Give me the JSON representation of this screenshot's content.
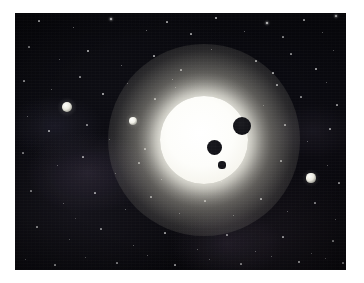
{
  "page": {
    "width": 364,
    "height": 283,
    "background_color": "#ffffff"
  },
  "image_frame": {
    "left": 15,
    "top": 13,
    "width": 331,
    "height": 257,
    "border_color": "#ffffff",
    "space_color": "#07070b"
  },
  "scene": {
    "type": "space-illustration",
    "description": "A bright white host star with three dark planets silhouetted in transit across its disk, plus three illuminated planets in the surrounding starfield",
    "background_color": "#07070b",
    "star_color": "#fffff5",
    "planet_shadow_color": "#14141a",
    "lit_planet_color": "#eceae2"
  },
  "host_star": {
    "name": "host-star",
    "center_x": 189,
    "center_y": 127,
    "radius": 44,
    "glow_radius": 96,
    "color": "#ffffff",
    "glow_color": "#fffdf0"
  },
  "transiting_planets": [
    {
      "name": "transit-planet-large-upper-right",
      "cx": 227,
      "cy": 113,
      "r": 9,
      "color": "#1b1b20"
    },
    {
      "name": "transit-planet-medium-center",
      "cx": 199,
      "cy": 134,
      "r": 7.5,
      "color": "#17171c"
    },
    {
      "name": "transit-planet-small-lower",
      "cx": 207,
      "cy": 152,
      "r": 3.6,
      "color": "#17171c"
    }
  ],
  "field_planets": [
    {
      "name": "field-planet-far-left",
      "cx": 52,
      "cy": 94,
      "r": 5.2,
      "color": "#e6e5dc"
    },
    {
      "name": "field-planet-mid-left",
      "cx": 118,
      "cy": 108,
      "r": 4.2,
      "color": "#eeede5"
    },
    {
      "name": "field-planet-right",
      "cx": 296,
      "cy": 165,
      "r": 4.6,
      "color": "#eceae1"
    }
  ],
  "background_stars": [
    {
      "x": 24,
      "y": 8,
      "s": 1.2,
      "o": 0.7
    },
    {
      "x": 58,
      "y": 14,
      "s": 1.0,
      "o": 0.55
    },
    {
      "x": 96,
      "y": 6,
      "s": 1.4,
      "o": 0.8
    },
    {
      "x": 131,
      "y": 17,
      "s": 1.0,
      "o": 0.5
    },
    {
      "x": 152,
      "y": 9,
      "s": 1.2,
      "o": 0.62
    },
    {
      "x": 176,
      "y": 21,
      "s": 1.1,
      "o": 0.58
    },
    {
      "x": 201,
      "y": 5,
      "s": 1.3,
      "o": 0.72
    },
    {
      "x": 229,
      "y": 18,
      "s": 1.0,
      "o": 0.48
    },
    {
      "x": 252,
      "y": 10,
      "s": 1.5,
      "o": 0.85
    },
    {
      "x": 268,
      "y": 24,
      "s": 1.1,
      "o": 0.55
    },
    {
      "x": 289,
      "y": 7,
      "s": 1.2,
      "o": 0.66
    },
    {
      "x": 307,
      "y": 19,
      "s": 1.0,
      "o": 0.5
    },
    {
      "x": 321,
      "y": 3,
      "s": 1.6,
      "o": 0.9
    },
    {
      "x": 14,
      "y": 34,
      "s": 1.1,
      "o": 0.52
    },
    {
      "x": 44,
      "y": 46,
      "s": 1.0,
      "o": 0.45
    },
    {
      "x": 73,
      "y": 38,
      "s": 1.3,
      "o": 0.68
    },
    {
      "x": 106,
      "y": 52,
      "s": 1.0,
      "o": 0.46
    },
    {
      "x": 139,
      "y": 43,
      "s": 1.2,
      "o": 0.6
    },
    {
      "x": 166,
      "y": 57,
      "s": 1.1,
      "o": 0.52
    },
    {
      "x": 196,
      "y": 36,
      "s": 1.0,
      "o": 0.44
    },
    {
      "x": 241,
      "y": 48,
      "s": 1.2,
      "o": 0.58
    },
    {
      "x": 276,
      "y": 41,
      "s": 1.1,
      "o": 0.54
    },
    {
      "x": 301,
      "y": 56,
      "s": 1.3,
      "o": 0.7
    },
    {
      "x": 318,
      "y": 37,
      "s": 1.0,
      "o": 0.48
    },
    {
      "x": 9,
      "y": 68,
      "s": 1.2,
      "o": 0.56
    },
    {
      "x": 36,
      "y": 76,
      "s": 1.0,
      "o": 0.44
    },
    {
      "x": 65,
      "y": 64,
      "s": 1.1,
      "o": 0.5
    },
    {
      "x": 88,
      "y": 81,
      "s": 1.3,
      "o": 0.66
    },
    {
      "x": 112,
      "y": 70,
      "s": 1.0,
      "o": 0.46
    },
    {
      "x": 140,
      "y": 86,
      "s": 1.1,
      "o": 0.52
    },
    {
      "x": 157,
      "y": 66,
      "s": 1.0,
      "o": 0.44
    },
    {
      "x": 262,
      "y": 72,
      "s": 1.2,
      "o": 0.58
    },
    {
      "x": 286,
      "y": 84,
      "s": 1.1,
      "o": 0.5
    },
    {
      "x": 311,
      "y": 69,
      "s": 1.0,
      "o": 0.46
    },
    {
      "x": 322,
      "y": 92,
      "s": 1.2,
      "o": 0.6
    },
    {
      "x": 12,
      "y": 103,
      "s": 1.0,
      "o": 0.44
    },
    {
      "x": 34,
      "y": 118,
      "s": 1.2,
      "o": 0.58
    },
    {
      "x": 72,
      "y": 112,
      "s": 1.1,
      "o": 0.5
    },
    {
      "x": 94,
      "y": 126,
      "s": 1.0,
      "o": 0.42
    },
    {
      "x": 130,
      "y": 136,
      "s": 1.1,
      "o": 0.48
    },
    {
      "x": 148,
      "y": 120,
      "s": 1.0,
      "o": 0.44
    },
    {
      "x": 270,
      "y": 112,
      "s": 1.1,
      "o": 0.52
    },
    {
      "x": 292,
      "y": 128,
      "s": 1.0,
      "o": 0.44
    },
    {
      "x": 315,
      "y": 116,
      "s": 1.2,
      "o": 0.58
    },
    {
      "x": 8,
      "y": 140,
      "s": 1.1,
      "o": 0.48
    },
    {
      "x": 42,
      "y": 152,
      "s": 1.0,
      "o": 0.42
    },
    {
      "x": 68,
      "y": 144,
      "s": 1.2,
      "o": 0.56
    },
    {
      "x": 100,
      "y": 160,
      "s": 1.0,
      "o": 0.44
    },
    {
      "x": 124,
      "y": 150,
      "s": 1.1,
      "o": 0.5
    },
    {
      "x": 146,
      "y": 166,
      "s": 1.0,
      "o": 0.42
    },
    {
      "x": 266,
      "y": 148,
      "s": 1.1,
      "o": 0.5
    },
    {
      "x": 312,
      "y": 152,
      "s": 1.0,
      "o": 0.44
    },
    {
      "x": 324,
      "y": 170,
      "s": 1.2,
      "o": 0.56
    },
    {
      "x": 16,
      "y": 178,
      "s": 1.1,
      "o": 0.48
    },
    {
      "x": 48,
      "y": 190,
      "s": 1.0,
      "o": 0.42
    },
    {
      "x": 80,
      "y": 180,
      "s": 1.2,
      "o": 0.56
    },
    {
      "x": 110,
      "y": 196,
      "s": 1.0,
      "o": 0.44
    },
    {
      "x": 136,
      "y": 184,
      "s": 1.1,
      "o": 0.5
    },
    {
      "x": 164,
      "y": 200,
      "s": 1.0,
      "o": 0.42
    },
    {
      "x": 190,
      "y": 188,
      "s": 1.1,
      "o": 0.48
    },
    {
      "x": 218,
      "y": 202,
      "s": 1.0,
      "o": 0.44
    },
    {
      "x": 246,
      "y": 186,
      "s": 1.2,
      "o": 0.56
    },
    {
      "x": 272,
      "y": 198,
      "s": 1.0,
      "o": 0.42
    },
    {
      "x": 300,
      "y": 190,
      "s": 1.1,
      "o": 0.5
    },
    {
      "x": 320,
      "y": 206,
      "s": 1.0,
      "o": 0.44
    },
    {
      "x": 22,
      "y": 214,
      "s": 1.2,
      "o": 0.58
    },
    {
      "x": 54,
      "y": 226,
      "s": 1.0,
      "o": 0.42
    },
    {
      "x": 86,
      "y": 216,
      "s": 1.1,
      "o": 0.5
    },
    {
      "x": 118,
      "y": 232,
      "s": 1.0,
      "o": 0.44
    },
    {
      "x": 150,
      "y": 220,
      "s": 1.2,
      "o": 0.56
    },
    {
      "x": 182,
      "y": 236,
      "s": 1.0,
      "o": 0.42
    },
    {
      "x": 212,
      "y": 222,
      "s": 1.1,
      "o": 0.5
    },
    {
      "x": 240,
      "y": 238,
      "s": 1.0,
      "o": 0.44
    },
    {
      "x": 268,
      "y": 224,
      "s": 1.2,
      "o": 0.58
    },
    {
      "x": 296,
      "y": 240,
      "s": 1.0,
      "o": 0.42
    },
    {
      "x": 318,
      "y": 228,
      "s": 1.1,
      "o": 0.5
    },
    {
      "x": 10,
      "y": 246,
      "s": 1.0,
      "o": 0.44
    },
    {
      "x": 40,
      "y": 252,
      "s": 1.2,
      "o": 0.56
    },
    {
      "x": 70,
      "y": 244,
      "s": 1.0,
      "o": 0.42
    },
    {
      "x": 102,
      "y": 250,
      "s": 1.1,
      "o": 0.5
    },
    {
      "x": 132,
      "y": 242,
      "s": 1.0,
      "o": 0.44
    },
    {
      "x": 160,
      "y": 252,
      "s": 1.2,
      "o": 0.56
    },
    {
      "x": 194,
      "y": 246,
      "s": 1.0,
      "o": 0.42
    },
    {
      "x": 226,
      "y": 251,
      "s": 1.1,
      "o": 0.5
    },
    {
      "x": 256,
      "y": 243,
      "s": 1.0,
      "o": 0.44
    },
    {
      "x": 284,
      "y": 249,
      "s": 1.3,
      "o": 0.66
    },
    {
      "x": 310,
      "y": 245,
      "s": 1.0,
      "o": 0.42
    },
    {
      "x": 328,
      "y": 250,
      "s": 1.1,
      "o": 0.5
    },
    {
      "x": 160,
      "y": 74,
      "s": 1.0,
      "o": 0.4
    },
    {
      "x": 248,
      "y": 92,
      "s": 1.0,
      "o": 0.4
    },
    {
      "x": 258,
      "y": 60,
      "s": 1.2,
      "o": 0.62
    },
    {
      "x": 178,
      "y": 95,
      "s": 0.9,
      "o": 0.35
    },
    {
      "x": 60,
      "y": 205,
      "s": 0.9,
      "o": 0.38
    },
    {
      "x": 206,
      "y": 168,
      "s": 0.9,
      "o": 0.35
    }
  ]
}
